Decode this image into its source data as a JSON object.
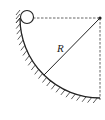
{
  "diagram": {
    "radius_label": "R",
    "elements": [
      "ball",
      "quarter-circle-track",
      "center-point",
      "radius-line",
      "dashed-horizontal",
      "dashed-vertical",
      "hatched-surface"
    ],
    "colors": {
      "line": "#222222",
      "dashed": "#555555"
    }
  }
}
